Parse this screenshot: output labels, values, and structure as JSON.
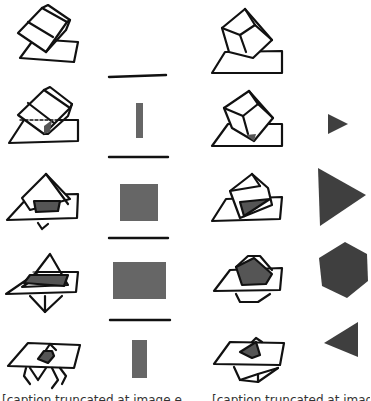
{
  "figure": {
    "colors": {
      "ink": "#111111",
      "section_fill": "#555555",
      "paper": "#ffffff"
    }
  },
  "left_series": {
    "label": "Rectangular block sliced by a plane — cross-sections",
    "rows": [
      {
        "step": 1,
        "section_shape": "none (line)",
        "description": "Plane touches edge"
      },
      {
        "step": 2,
        "section_shape": "thin rectangle",
        "description": "Shallow cut"
      },
      {
        "step": 3,
        "section_shape": "square",
        "description": "Mid cut"
      },
      {
        "step": 4,
        "section_shape": "wide rectangle",
        "description": "Deep cut"
      },
      {
        "step": 5,
        "section_shape": "narrow rectangle",
        "description": "Near opposite edge"
      }
    ]
  },
  "right_series": {
    "label": "Cube balanced on a vertex sliced by a plane — cross-sections",
    "rows": [
      {
        "step": 1,
        "section_shape": "none (point)"
      },
      {
        "step": 2,
        "section_shape": "small triangle"
      },
      {
        "step": 3,
        "section_shape": "large triangle"
      },
      {
        "step": 4,
        "section_shape": "hexagon"
      },
      {
        "step": 5,
        "section_shape": "triangle (inverted)"
      }
    ]
  },
  "captions": {
    "left": "[caption truncated at image edge — unreadable]",
    "right": "[caption truncated at image edge — unreadable]"
  }
}
